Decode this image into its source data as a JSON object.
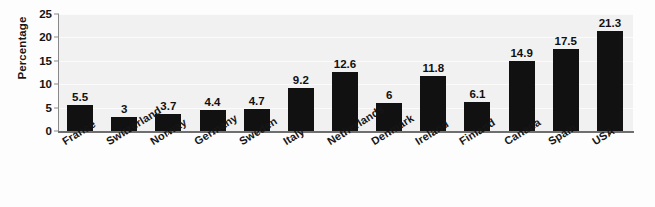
{
  "chart_data": {
    "type": "bar",
    "title": "",
    "subtitle": "",
    "xlabel": "",
    "ylabel": "Percentage",
    "ylim": [
      0,
      25
    ],
    "y_ticks": [
      0,
      5,
      10,
      15,
      20,
      25
    ],
    "y_tick_labels": [
      "0",
      "5",
      "10",
      "15",
      "20",
      "25"
    ],
    "grid": true,
    "grid_axis": "y",
    "legend": false,
    "legend_position": "none",
    "orientation": "vertical",
    "categories": [
      "France",
      "Switzerland",
      "Norway",
      "Germany",
      "Sweden",
      "Italy",
      "Netherlands",
      "Denmark",
      "Ireland",
      "Finland",
      "Canada",
      "Spain",
      "USA"
    ],
    "values": [
      5.5,
      3,
      3.7,
      4.4,
      4.7,
      9.2,
      12.6,
      6,
      11.8,
      6.1,
      14.9,
      17.5,
      21.3
    ],
    "data_labels": [
      "5.5",
      "3",
      "3.7",
      "4.4",
      "4.7",
      "9.2",
      "12.6",
      "6",
      "11.8",
      "6.1",
      "14.9",
      "17.5",
      "21.3"
    ],
    "series": [
      {
        "name": "Percentage",
        "values": [
          5.5,
          3,
          3.7,
          4.4,
          4.7,
          9.2,
          12.6,
          6,
          11.8,
          6.1,
          14.9,
          17.5,
          21.3
        ]
      }
    ],
    "colors": {
      "bar": "#111111",
      "plot_background": "#f1f1f1",
      "figure_background": "#fdfdfd",
      "gridline": "#fbfbfb",
      "axis": "#7a7a7a",
      "text": "#141414"
    }
  }
}
